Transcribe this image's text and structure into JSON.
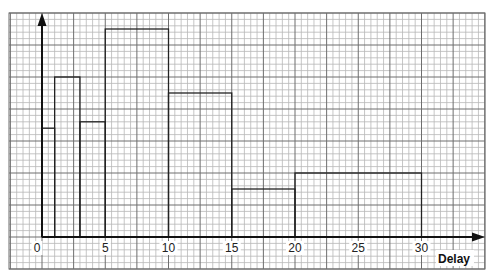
{
  "chart_data": {
    "type": "bar",
    "subtype": "histogram",
    "title": "",
    "xlabel": "Delay",
    "ylabel": "",
    "xlim": [
      0,
      35
    ],
    "ylim": [
      0,
      35
    ],
    "grid": true,
    "legend": null,
    "x_ticks": [
      0,
      5,
      10,
      15,
      20,
      25,
      30
    ],
    "x_tick_labels": [
      "0",
      "5",
      "10",
      "15",
      "20",
      "25",
      "30"
    ],
    "bins": [
      {
        "from": 0,
        "to": 1,
        "height": 17
      },
      {
        "from": 1,
        "to": 3,
        "height": 25
      },
      {
        "from": 3,
        "to": 5,
        "height": 18
      },
      {
        "from": 5,
        "to": 10,
        "height": 32.5
      },
      {
        "from": 10,
        "to": 15,
        "height": 22.5
      },
      {
        "from": 15,
        "to": 20,
        "height": 7.5
      },
      {
        "from": 20,
        "to": 30,
        "height": 10
      }
    ],
    "categories": [
      "0-1",
      "1-3",
      "3-5",
      "5-10",
      "10-15",
      "15-20",
      "20-30"
    ],
    "values": [
      17,
      25,
      18,
      32.5,
      22.5,
      7.5,
      10
    ],
    "height_units": "small grid squares (frequency density, unlabeled)"
  },
  "colors": {
    "minor_grid": "#b8b8b8",
    "major_grid": "#6e6e6e",
    "bars": "#222222",
    "axis": "#111111"
  }
}
